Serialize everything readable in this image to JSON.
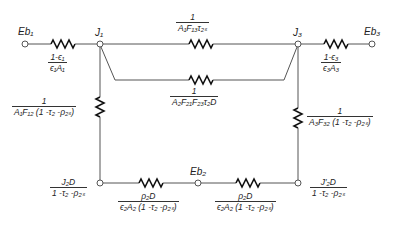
{
  "diagram": {
    "type": "radiation-network",
    "nodes": {
      "eb1": "E_b1",
      "j1": "J_1",
      "j3": "J_3",
      "eb3": "E_b3",
      "eb2": "E_b2"
    },
    "labels": {
      "eb1": "Eb₁",
      "j1": "J₁",
      "j3": "J₃",
      "eb3": "Eb₃",
      "eb2": "Eb₂"
    },
    "resistances": {
      "surface1": {
        "num": "1-ϵ₁",
        "den": "ϵ₁A₁"
      },
      "surface3": {
        "num": "1-ϵ₃",
        "den": "ϵ₃A₃"
      },
      "j1_j3_direct": {
        "num": "1",
        "den": "A₁F₁₃τ₂ₛ"
      },
      "j1_j3_diffuse": {
        "num": "1",
        "den": "A₂F₂₁F₂₃τ₂D"
      },
      "j1_j2d": {
        "num": "1",
        "den": "A₁F₁₂ (1 -τ₂ -ρ₂ₛ)"
      },
      "j3_j2d_prime": {
        "num": "1",
        "den": "A₃F₃₂ (1 -τ₂ -ρ₂ₛ)"
      },
      "j2d_eb2": {
        "num": "ρ₂D",
        "den": "ϵ₂A₂ (1 -τ₂ -ρ₂ₛ)"
      },
      "eb2_j2d_prime": {
        "num": "ρ₂D",
        "den": "ϵ₂A₂ (1 -τ₂ -ρ₂ₛ)"
      }
    },
    "potentials": {
      "j2d": {
        "num": "J₂D",
        "den": "1 -τ₂ -ρ₂ₛ"
      },
      "j2d_prime": {
        "num": "J′₂D",
        "den": "1 -τ₂ -ρ₂ₛ"
      }
    }
  }
}
